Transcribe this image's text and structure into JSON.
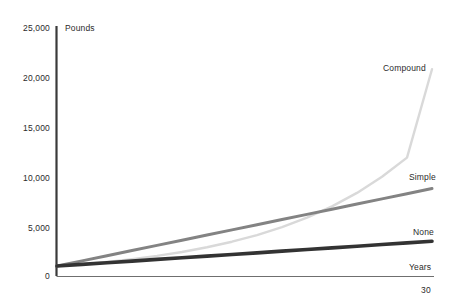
{
  "chart_data": {
    "type": "line",
    "title": "",
    "xlabel": "Years",
    "ylabel": "Pounds",
    "xlim": [
      0,
      30
    ],
    "ylim": [
      0,
      25000
    ],
    "grid": false,
    "legend_position": "line-end-labels",
    "y_ticks": [
      25000,
      20000,
      15000,
      10000,
      5000,
      0
    ],
    "y_tick_labels": [
      "25,000",
      "20,000",
      "15,000",
      "10,000",
      "5,000",
      "0"
    ],
    "x_ticks": [
      30
    ],
    "x_tick_labels": [
      "30"
    ],
    "x": [
      0,
      2,
      4,
      6,
      8,
      10,
      12,
      14,
      16,
      18,
      20,
      22,
      24,
      26,
      28,
      30
    ],
    "series": [
      {
        "name": "Compound",
        "color": "#d9d9d9",
        "values": [
          1000,
          1190,
          1420,
          1700,
          2030,
          2420,
          2890,
          3450,
          4120,
          4920,
          5870,
          7010,
          8360,
          9980,
          11910,
          20800
        ],
        "end_value": 20800
      },
      {
        "name": "Simple",
        "color": "#838383",
        "values": [
          1000,
          1520,
          2040,
          2560,
          3080,
          3600,
          4120,
          4640,
          5160,
          5680,
          6200,
          6720,
          7240,
          7760,
          8280,
          8800
        ],
        "end_value": 8800
      },
      {
        "name": "None",
        "color": "#333333",
        "values": [
          1000,
          1170,
          1330,
          1500,
          1670,
          1830,
          2000,
          2170,
          2330,
          2500,
          2670,
          2830,
          3000,
          3170,
          3330,
          3500
        ],
        "end_value": 3500
      }
    ]
  },
  "axis": {
    "y_title": "Pounds",
    "x_title": "Years",
    "x_end_tick": "30"
  },
  "y_tick_labels": {
    "t0": "25,000",
    "t1": "20,000",
    "t2": "15,000",
    "t3": "10,000",
    "t4": "5,000",
    "t5": "0"
  },
  "series_labels": {
    "compound": "Compound",
    "simple": "Simple",
    "none": "None"
  },
  "colors": {
    "compound": "#d9d9d9",
    "simple": "#838383",
    "none": "#333333",
    "y_axis": "#3a3a3a",
    "x_axis": "#6f6f6f",
    "text": "#2b2b2b"
  }
}
